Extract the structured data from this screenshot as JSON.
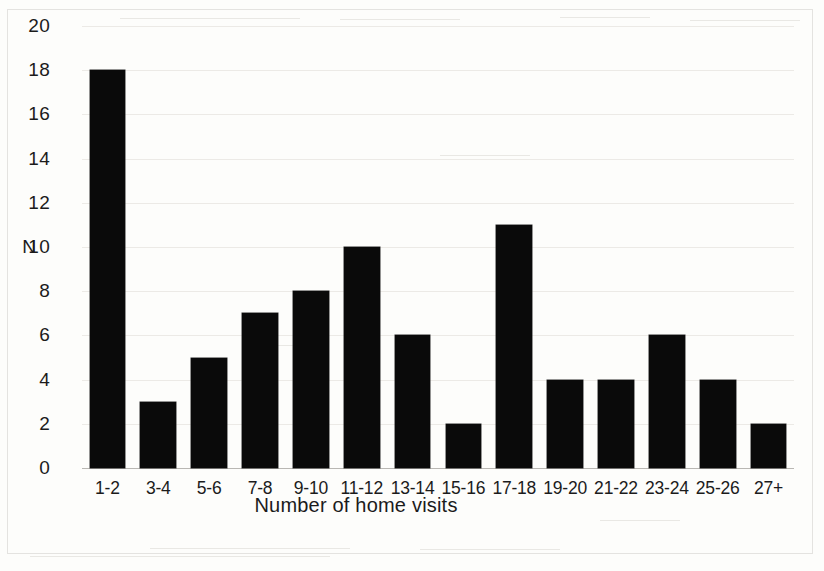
{
  "chart_data": {
    "type": "bar",
    "title": "",
    "subtitle": "",
    "xlabel": "Number of home visits",
    "ylabel": "N",
    "categories": [
      "1-2",
      "3-4",
      "5-6",
      "7-8",
      "9-10",
      "11-12",
      "13-14",
      "15-16",
      "17-18",
      "19-20",
      "21-22",
      "23-24",
      "25-26",
      "27+"
    ],
    "values": [
      18,
      3,
      5,
      7,
      8,
      10,
      6,
      2,
      11,
      4,
      4,
      6,
      4,
      2
    ],
    "series": [
      {
        "name": "N",
        "values": [
          18,
          3,
          5,
          7,
          8,
          10,
          6,
          2,
          11,
          4,
          4,
          6,
          4,
          2
        ]
      }
    ],
    "ylim": [
      0,
      20
    ],
    "yticks": [
      0,
      2,
      4,
      6,
      8,
      10,
      12,
      14,
      16,
      18,
      20
    ],
    "ytick_labels": [
      "0",
      "2",
      "4",
      "6",
      "8",
      "10",
      "12",
      "14",
      "16",
      "18",
      "20"
    ],
    "grid": true,
    "grid_axis": "y",
    "legend": false,
    "legend_position": "none",
    "bar_color": "#0a0a0a",
    "background_color": "#fdfdfb",
    "gridline_color": "#eceae6",
    "axis_color": "#b9b7b3",
    "text_color": "#1b1b1b",
    "annotations": []
  },
  "figure": {
    "axis_label_n": "N",
    "axis_label_x": "Number of home visits"
  }
}
